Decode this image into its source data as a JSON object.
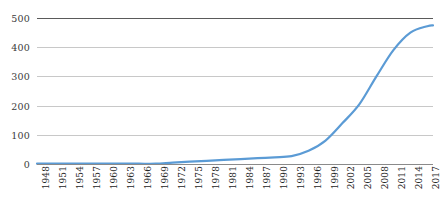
{
  "chart_data": {
    "type": "line",
    "title": "",
    "subtitle": "",
    "xlabel": "",
    "ylabel": "",
    "legend": [],
    "legend_position": "none",
    "grid": true,
    "grid_axis": "y",
    "xlim": [
      1948,
      2018
    ],
    "ylim": [
      0,
      500
    ],
    "yticks": [
      0,
      100,
      200,
      300,
      400,
      500
    ],
    "ytick_labels": [
      "0",
      "100",
      "200",
      "300",
      "400",
      "500"
    ],
    "xtick_labels": [
      "1948",
      "1951",
      "1954",
      "1957",
      "1960",
      "1963",
      "1966",
      "1969",
      "1972",
      "1975",
      "1978",
      "1981",
      "1984",
      "1987",
      "1990",
      "1993",
      "1996",
      "1999",
      "2002",
      "2005",
      "2008",
      "2011",
      "2014",
      "2017"
    ],
    "xticks": [
      1948,
      1951,
      1954,
      1957,
      1960,
      1963,
      1966,
      1969,
      1972,
      1975,
      1978,
      1981,
      1984,
      1987,
      1990,
      1993,
      1996,
      1999,
      2002,
      2005,
      2008,
      2011,
      2014,
      2017
    ],
    "series": [
      {
        "name": "series-1",
        "color": "#5B9BD5",
        "x": [
          1948,
          1951,
          1954,
          1957,
          1960,
          1963,
          1966,
          1969,
          1972,
          1975,
          1978,
          1981,
          1984,
          1987,
          1990,
          1993,
          1996,
          1999,
          2002,
          2005,
          2008,
          2011,
          2014,
          2017,
          2018
        ],
        "values": [
          1,
          1,
          1,
          1,
          1,
          1,
          1,
          1,
          5,
          8,
          11,
          14,
          17,
          20,
          23,
          27,
          45,
          80,
          140,
          205,
          300,
          390,
          450,
          472,
          475
        ]
      }
    ]
  },
  "axes": {
    "y_axis_name": "value-axis",
    "x_axis_name": "year-axis"
  },
  "colors": {
    "line": "#5B9BD5",
    "grid": "#C8C8C8",
    "top_grid": "#5A5A5A",
    "baseline": "#8A8A8A",
    "label_text": "#262626",
    "background": "#FFFFFF"
  }
}
